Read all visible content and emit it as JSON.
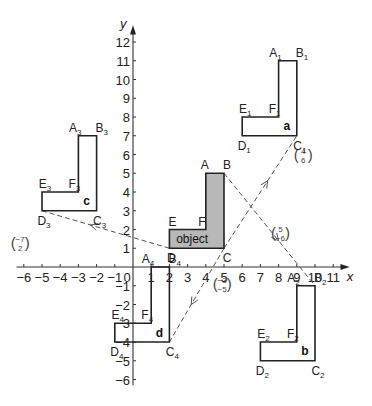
{
  "figure": {
    "axes": {
      "x_label": "x",
      "y_label": "y",
      "x_ticks": [
        -6,
        -5,
        -4,
        -3,
        -2,
        -1,
        0,
        1,
        2,
        3,
        4,
        5,
        6,
        7,
        8,
        9,
        10,
        11
      ],
      "y_ticks": [
        12,
        11,
        10,
        9,
        8,
        7,
        6,
        5,
        4,
        3,
        2,
        1,
        -1,
        -2,
        -3,
        -4,
        -5,
        -6
      ],
      "origin_label": "0"
    },
    "object": {
      "label": "object",
      "vertices": {
        "A": [
          4,
          5
        ],
        "B": [
          5,
          5
        ],
        "C": [
          5,
          1
        ],
        "D": [
          2,
          1
        ],
        "E": [
          2,
          2
        ],
        "F": [
          4,
          2
        ]
      },
      "fill": "#b8b8b8"
    },
    "images": [
      {
        "name": "a",
        "suffix": "1",
        "vertices": {
          "A": [
            8,
            11
          ],
          "B": [
            9,
            11
          ],
          "C": [
            9,
            7
          ],
          "D": [
            6,
            7
          ],
          "E": [
            6,
            8
          ],
          "F": [
            8,
            8
          ]
        }
      },
      {
        "name": "b",
        "suffix": "2",
        "vertices": {
          "A": [
            9,
            -1
          ],
          "B": [
            10,
            -1
          ],
          "C": [
            10,
            -5
          ],
          "D": [
            7,
            -5
          ],
          "E": [
            7,
            -4
          ],
          "F": [
            9,
            -4
          ]
        }
      },
      {
        "name": "c",
        "suffix": "3",
        "vertices": {
          "A": [
            -3,
            7
          ],
          "B": [
            -2,
            7
          ],
          "C": [
            -2,
            3
          ],
          "D": [
            -5,
            3
          ],
          "E": [
            -5,
            4
          ],
          "F": [
            -3,
            4
          ]
        }
      },
      {
        "name": "d",
        "suffix": "4",
        "vertices": {
          "A": [
            1,
            0
          ],
          "B": [
            2,
            0
          ],
          "C": [
            2,
            -4
          ],
          "D": [
            -1,
            -4
          ],
          "E": [
            -1,
            -3
          ],
          "F": [
            1,
            -3
          ]
        }
      }
    ],
    "translations": [
      {
        "from": "C",
        "to": "C1",
        "vector": [
          4,
          6
        ],
        "top": "4",
        "bottom": "6"
      },
      {
        "from": "B",
        "to": "B2",
        "vector": [
          5,
          -6
        ],
        "top": "5",
        "bottom": "−6"
      },
      {
        "from": "D",
        "to": "D3",
        "vector": [
          -7,
          2
        ],
        "top": "−7",
        "bottom": "2"
      },
      {
        "from": "C",
        "to": "C4",
        "vector": [
          -3,
          -5
        ],
        "top": "−3",
        "bottom": "−5"
      }
    ]
  }
}
